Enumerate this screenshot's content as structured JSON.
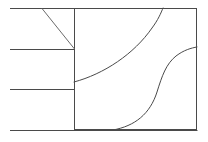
{
  "figure": {
    "type": "line-diagram",
    "title": "",
    "background_color": "#ffffff",
    "stroke_color": "#4a4a4a",
    "canvas": {
      "width": 208,
      "height": 142
    },
    "panel": {
      "name": "right-panel-rectangle",
      "x": 74,
      "y": 8,
      "width": 123,
      "height": 122
    },
    "divider": {
      "name": "vertical-divider",
      "x": 74,
      "y1": 8,
      "y2": 130
    },
    "horizontal_lines": [
      {
        "name": "line-top",
        "x1": 10,
        "y1": 8,
        "x2": 74,
        "y2": 8
      },
      {
        "name": "line-second",
        "x1": 10,
        "y1": 49,
        "x2": 74,
        "y2": 49
      },
      {
        "name": "line-third",
        "x1": 10,
        "y1": 89,
        "x2": 74,
        "y2": 89
      },
      {
        "name": "line-bottom",
        "x1": 10,
        "y1": 130,
        "x2": 197,
        "y2": 130
      }
    ],
    "diagonal": {
      "name": "diagonal-segment",
      "x1": 42,
      "y1": 8,
      "x2": 74,
      "y2": 49
    },
    "curves": [
      {
        "name": "upper-concave-curve",
        "description": "curve rising from left edge of panel to top edge",
        "path": "M 74 82 C 104 74, 134 54, 152 28 C 158 20, 161 13, 163 8"
      },
      {
        "name": "lower-s-curve",
        "description": "S-shaped curve from bottom edge rising to right edge",
        "path": "M 113 130 C 135 126, 150 114, 157 92 C 162 76, 166 64, 176 56 C 184 50, 191 48, 197 47"
      }
    ]
  }
}
